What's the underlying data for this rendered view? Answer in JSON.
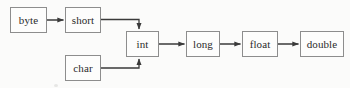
{
  "diagram": {
    "background_color": "#fbfbfa",
    "box_border_color": "#8d8d8d",
    "box_fill_color": "#fdfdfc",
    "edge_color": "#3a3a3a",
    "text_color": "#2b2b2b",
    "nodes": [
      {
        "id": "byte",
        "label": "byte",
        "x": 10,
        "y": 7,
        "w": 37,
        "h": 26
      },
      {
        "id": "short",
        "label": "short",
        "x": 65,
        "y": 7,
        "w": 36,
        "h": 26
      },
      {
        "id": "char",
        "label": "char",
        "x": 65,
        "y": 55,
        "w": 36,
        "h": 26
      },
      {
        "id": "int",
        "label": "int",
        "x": 126,
        "y": 31,
        "w": 33,
        "h": 26
      },
      {
        "id": "long",
        "label": "long",
        "x": 186,
        "y": 31,
        "w": 34,
        "h": 26
      },
      {
        "id": "float",
        "label": "float",
        "x": 242,
        "y": 31,
        "w": 36,
        "h": 26
      },
      {
        "id": "double",
        "label": "double",
        "x": 300,
        "y": 31,
        "w": 44,
        "h": 26
      }
    ],
    "edges": [
      {
        "id": "byte-to-short",
        "from": "byte",
        "to": "short",
        "kind": "straight-right"
      },
      {
        "id": "short-to-int",
        "from": "short",
        "to": "int",
        "kind": "elbow-down"
      },
      {
        "id": "char-to-int",
        "from": "char",
        "to": "int",
        "kind": "elbow-up"
      },
      {
        "id": "int-to-long",
        "from": "int",
        "to": "long",
        "kind": "straight-right"
      },
      {
        "id": "long-to-float",
        "from": "long",
        "to": "float",
        "kind": "straight-right"
      },
      {
        "id": "float-to-double",
        "from": "float",
        "to": "double",
        "kind": "straight-right"
      }
    ]
  }
}
